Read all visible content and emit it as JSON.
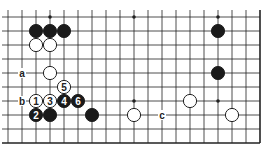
{
  "diagram": {
    "type": "go-board-fragment",
    "grid": {
      "x0": 8,
      "y0": 17,
      "step": 14,
      "cols": 19,
      "rows": 10,
      "right_edge": true,
      "bottom_edge": true
    },
    "colors": {
      "line": "#222222",
      "black": "#1a1a1a",
      "white": "#ffffff",
      "background": "#ffffff"
    },
    "star_points": [
      [
        3,
        0
      ],
      [
        9,
        0
      ],
      [
        15,
        0
      ],
      [
        9,
        6
      ],
      [
        15,
        6
      ],
      [
        3,
        6
      ]
    ],
    "stones": [
      {
        "col": 2,
        "row": 1,
        "color": "black",
        "label": ""
      },
      {
        "col": 3,
        "row": 1,
        "color": "black",
        "label": ""
      },
      {
        "col": 4,
        "row": 1,
        "color": "black",
        "label": ""
      },
      {
        "col": 2,
        "row": 2,
        "color": "white",
        "label": ""
      },
      {
        "col": 3,
        "row": 2,
        "color": "white",
        "label": ""
      },
      {
        "col": 15,
        "row": 1,
        "color": "black",
        "label": ""
      },
      {
        "col": 3,
        "row": 4,
        "color": "white",
        "label": ""
      },
      {
        "col": 15,
        "row": 4,
        "color": "black",
        "label": ""
      },
      {
        "col": 4,
        "row": 5,
        "color": "white",
        "label": "5"
      },
      {
        "col": 2,
        "row": 6,
        "color": "white",
        "label": "1"
      },
      {
        "col": 3,
        "row": 6,
        "color": "white",
        "label": "3"
      },
      {
        "col": 4,
        "row": 6,
        "color": "black",
        "label": "4"
      },
      {
        "col": 5,
        "row": 6,
        "color": "black",
        "label": "6"
      },
      {
        "col": 13,
        "row": 6,
        "color": "white",
        "label": ""
      },
      {
        "col": 2,
        "row": 7,
        "color": "black",
        "label": "2"
      },
      {
        "col": 3,
        "row": 7,
        "color": "black",
        "label": ""
      },
      {
        "col": 6,
        "row": 7,
        "color": "black",
        "label": ""
      },
      {
        "col": 9,
        "row": 7,
        "color": "white",
        "label": ""
      },
      {
        "col": 16,
        "row": 7,
        "color": "white",
        "label": ""
      }
    ],
    "letters": [
      {
        "col": 1,
        "row": 4,
        "text": "a"
      },
      {
        "col": 1,
        "row": 6,
        "text": "b"
      },
      {
        "col": 11,
        "row": 7,
        "text": "c"
      }
    ]
  }
}
